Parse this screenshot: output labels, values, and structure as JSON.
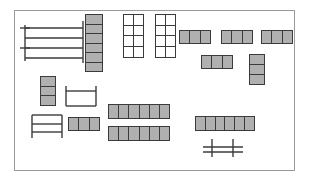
{
  "document": {
    "title": "Floor Plan Layout",
    "background_color": "#ffffff"
  },
  "plan": {
    "name": "floor-plan",
    "border_color": "#9a9a9a",
    "fill_color": "#b0b0b0",
    "stroke_color": "#3b3b3b",
    "width": 281,
    "height": 161,
    "objects": [
      {
        "id": "comb-rack-top-left",
        "type": "lineart",
        "label": "Comb rack",
        "x": 4,
        "y": 10,
        "w": 66,
        "h": 44
      },
      {
        "id": "desk-column-left",
        "type": "cells",
        "label": "Vertical desk column",
        "orientation": "vertical",
        "count": 6,
        "x": 70,
        "y": 3,
        "w": 18,
        "h": 58
      },
      {
        "id": "open-grid-a",
        "type": "grid",
        "label": "Open shelving grid A",
        "cols": 2,
        "rows": 4,
        "x": 108,
        "y": 3,
        "w": 21,
        "h": 44
      },
      {
        "id": "open-grid-b",
        "type": "grid",
        "label": "Open shelving grid B",
        "cols": 2,
        "rows": 4,
        "x": 140,
        "y": 3,
        "w": 21,
        "h": 44
      },
      {
        "id": "desk-row-top-1",
        "type": "cells",
        "label": "Desk row top 1",
        "orientation": "horizontal",
        "count": 3,
        "x": 164,
        "y": 19,
        "w": 32,
        "h": 14
      },
      {
        "id": "desk-row-top-2",
        "type": "cells",
        "label": "Desk row top 2",
        "orientation": "horizontal",
        "count": 3,
        "x": 206,
        "y": 19,
        "w": 32,
        "h": 14
      },
      {
        "id": "desk-row-top-3",
        "type": "cells",
        "label": "Desk row top 3",
        "orientation": "horizontal",
        "count": 3,
        "x": 246,
        "y": 19,
        "w": 32,
        "h": 14
      },
      {
        "id": "desk-row-mid-right",
        "type": "cells",
        "label": "Desk row mid right",
        "orientation": "horizontal",
        "count": 3,
        "x": 186,
        "y": 44,
        "w": 32,
        "h": 14
      },
      {
        "id": "desk-column-right",
        "type": "cells",
        "label": "Vertical desk column right",
        "orientation": "vertical",
        "count": 3,
        "x": 234,
        "y": 43,
        "w": 16,
        "h": 31
      },
      {
        "id": "desk-column-mid-left",
        "type": "cells",
        "label": "Vertical desk column mid left",
        "orientation": "vertical",
        "count": 3,
        "x": 25,
        "y": 65,
        "w": 16,
        "h": 30
      },
      {
        "id": "u-table",
        "type": "lineart",
        "label": "U shaped table",
        "x": 50,
        "y": 74,
        "w": 32,
        "h": 22
      },
      {
        "id": "ladder-shelf",
        "type": "lineart",
        "label": "Ladder shelf",
        "x": 16,
        "y": 103,
        "w": 32,
        "h": 25
      },
      {
        "id": "desk-row-mid-left",
        "type": "cells",
        "label": "Desk row mid left",
        "orientation": "horizontal",
        "count": 3,
        "x": 53,
        "y": 106,
        "w": 32,
        "h": 14
      },
      {
        "id": "desk-row-long-1",
        "type": "cells",
        "label": "Long desk row 1",
        "orientation": "horizontal",
        "count": 6,
        "x": 93,
        "y": 93,
        "w": 62,
        "h": 15
      },
      {
        "id": "desk-row-long-2",
        "type": "cells",
        "label": "Long desk row 2",
        "orientation": "horizontal",
        "count": 6,
        "x": 93,
        "y": 115,
        "w": 62,
        "h": 15
      },
      {
        "id": "desk-row-long-3",
        "type": "cells",
        "label": "Long desk row 3",
        "orientation": "horizontal",
        "count": 6,
        "x": 180,
        "y": 105,
        "w": 60,
        "h": 15
      },
      {
        "id": "bench-bottom",
        "type": "lineart",
        "label": "Bench",
        "x": 188,
        "y": 128,
        "w": 40,
        "h": 18
      }
    ]
  }
}
